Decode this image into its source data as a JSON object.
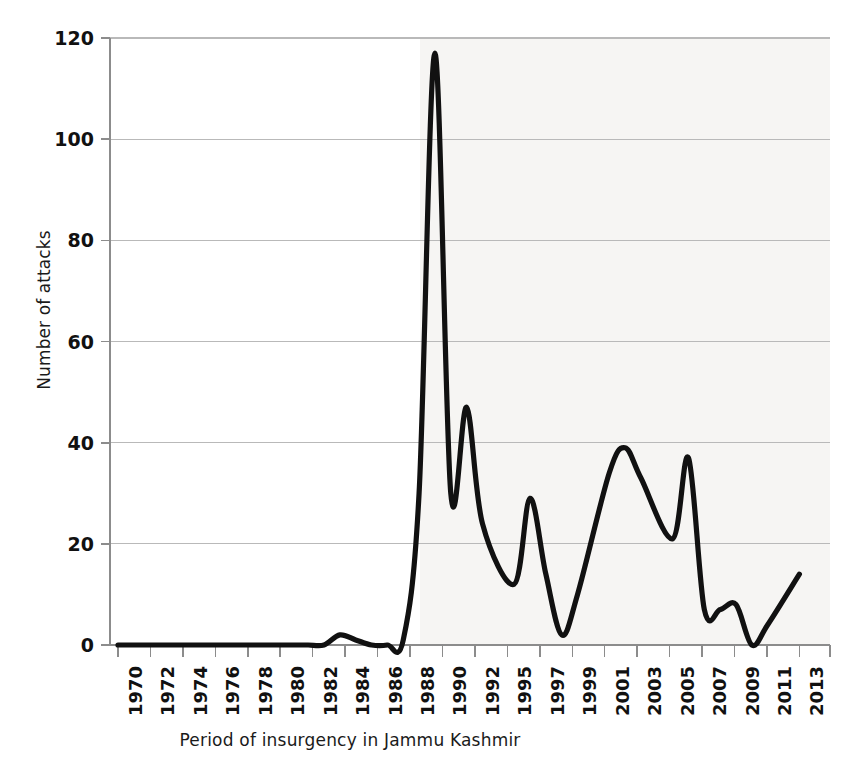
{
  "chart_data": {
    "type": "line",
    "title": "",
    "xlabel": "Period of insurgency in Jammu  Kashmir",
    "ylabel": "Number of attacks",
    "ylim": [
      0,
      120
    ],
    "yticks": [
      0,
      20,
      40,
      60,
      80,
      100,
      120
    ],
    "xticklabels": [
      "1970",
      "1972",
      "1974",
      "1976",
      "1978",
      "1980",
      "1982",
      "1984",
      "1986",
      "1988",
      "1990",
      "1992",
      "1995",
      "1997",
      "1999",
      "2001",
      "2003",
      "2005",
      "2007",
      "2009",
      "2011",
      "2013"
    ],
    "grid": true,
    "grid_axis": "y",
    "legend": "none",
    "line_color": "#111111",
    "line_width": 5,
    "x": [
      1970,
      1971,
      1972,
      1973,
      1974,
      1975,
      1976,
      1977,
      1978,
      1979,
      1980,
      1981,
      1982,
      1983,
      1984,
      1985,
      1986,
      1987,
      1988,
      1989,
      1990,
      1991,
      1992,
      1993,
      1995,
      1996,
      1997,
      1998,
      1999,
      2001,
      2002,
      2003,
      2005,
      2006,
      2007,
      2008,
      2009,
      2010,
      2011,
      2013
    ],
    "values": [
      0,
      0,
      0,
      0,
      0,
      0,
      0,
      0,
      0,
      0,
      0,
      0,
      0,
      0,
      2,
      1,
      0,
      0,
      1,
      30,
      117,
      30,
      47,
      24,
      12,
      29,
      14,
      2,
      10,
      34,
      39,
      33,
      21,
      37,
      7,
      7,
      8,
      0,
      4,
      14
    ],
    "series": [
      {
        "name": "Number of attacks",
        "values": [
          0,
          0,
          0,
          0,
          0,
          0,
          0,
          0,
          0,
          0,
          0,
          0,
          0,
          0,
          2,
          1,
          0,
          0,
          1,
          30,
          117,
          30,
          47,
          24,
          12,
          29,
          14,
          2,
          10,
          34,
          39,
          33,
          21,
          37,
          7,
          7,
          8,
          0,
          4,
          14
        ]
      }
    ],
    "annotations": {
      "peak_year": "1990",
      "peak_value": "117"
    }
  },
  "axes": {
    "y_title": "Number of attacks",
    "x_title": "Period of insurgency in Jammu  Kashmir",
    "y_tick_labels": [
      "0",
      "20",
      "40",
      "60",
      "80",
      "100",
      "120"
    ],
    "x_tick_labels": [
      "1970",
      "1972",
      "1974",
      "1976",
      "1978",
      "1980",
      "1982",
      "1984",
      "1986",
      "1988",
      "1990",
      "1992",
      "1995",
      "1997",
      "1999",
      "2001",
      "2003",
      "2005",
      "2007",
      "2009",
      "2011",
      "2013"
    ]
  },
  "style": {
    "line_color": "#111111",
    "grid_color": "#b9b9b9",
    "axis_color": "#8c8c8c",
    "text_color": "#111111",
    "background": "#ffffff"
  }
}
